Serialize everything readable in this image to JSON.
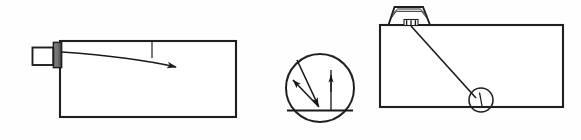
{
  "sheet": {
    "title": "Technical line drawing: tank with probe, reflection detail, and tank with sensor",
    "width": 581,
    "height": 140,
    "background_color": "#fefefe",
    "ink_color": "#1a1a1a",
    "stroke_color": "#222222"
  },
  "figures": [
    {
      "id": "left-figure",
      "name": "tank-with-side-mounted-probe",
      "label": "",
      "elements": {
        "tank_rect": {
          "name": "tank-outline",
          "x": 60,
          "y": 41,
          "width": 176,
          "height": 76,
          "stroke_width": 2.1
        },
        "probe_body": {
          "name": "probe-housing",
          "x": 32,
          "y": 47,
          "width": 22,
          "height": 18
        },
        "probe_thread": {
          "name": "threaded-collar",
          "x": 54,
          "y": 42,
          "width": 8,
          "height": 26,
          "thread_lines": 9
        },
        "beam_arrow": {
          "name": "beam-path-arrow",
          "start_x": 62,
          "start_y": 52,
          "control_x": 130,
          "control_y": 58,
          "end_x": 180,
          "end_y": 68
        },
        "tick_mark": {
          "name": "reference-tick",
          "x": 152,
          "y_top": 41,
          "y_bottom": 58
        }
      }
    },
    {
      "id": "center-figure",
      "name": "reflection-angle-detail-circle",
      "label": "",
      "elements": {
        "detail_circle": {
          "name": "detail-circle-outline",
          "cx": 320,
          "cy": 88,
          "r": 34,
          "stroke_width": 2.0
        },
        "surface_line": {
          "name": "surface-line",
          "x1": 288,
          "y1": 111,
          "x2": 352,
          "y2": 111
        },
        "normal_line": {
          "name": "normal-line",
          "x1": 331,
          "y1": 72,
          "x2": 331,
          "y2": 111
        },
        "incident_ray": {
          "name": "incident-ray-arrow",
          "x1": 299,
          "y1": 62,
          "x2": 319,
          "y2": 107
        },
        "reflected_ray": {
          "name": "reflected-ray-arrow",
          "x1": 319,
          "y1": 107,
          "x2": 293,
          "y2": 81
        },
        "normal_arrow": {
          "name": "normal-direction-arrow",
          "x1": 331,
          "y1": 90,
          "x2": 331,
          "y2": 74
        }
      }
    },
    {
      "id": "right-figure",
      "name": "tank-with-top-mounted-sensor",
      "label": "",
      "elements": {
        "tank_rect": {
          "name": "tank-outline",
          "x": 380,
          "y": 25,
          "width": 183,
          "height": 82,
          "stroke_width": 2.1
        },
        "sensor_housing": {
          "name": "sensor-housing-trapezoid",
          "top_left_x": 394,
          "top_right_x": 422,
          "bottom_left_x": 388,
          "bottom_right_x": 430,
          "top_y": 6,
          "bottom_y": 25,
          "rib_lines": 3
        },
        "sensor_nipple": {
          "name": "sensor-connector-teeth",
          "x": 404,
          "y": 20,
          "width": 14,
          "height": 6,
          "teeth": 3
        },
        "beam_line": {
          "name": "beam-path-line",
          "x1": 411,
          "y1": 26,
          "x2": 478,
          "y2": 100
        },
        "target_circle": {
          "name": "target-detail-circle",
          "cx": 481,
          "cy": 100,
          "r": 12,
          "stroke_width": 1.6
        },
        "target_mark": {
          "name": "target-tick-mark",
          "x1": 479,
          "y1": 93,
          "x2": 481,
          "y2": 106
        }
      }
    }
  ],
  "icons": {
    "probe_icon": "probe-icon",
    "sensor_icon": "sensor-icon",
    "detail_circle_icon": "detail-circle-icon",
    "arrow_icon": "arrow-icon"
  }
}
